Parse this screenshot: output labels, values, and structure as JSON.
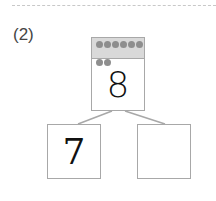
{
  "problem": {
    "label": "(2)",
    "whole": {
      "value": "8",
      "dot_count": 8,
      "dot_color": "#8e8e8e",
      "band_color": "#d9d9d9"
    },
    "parts": [
      {
        "value": "7"
      },
      {
        "value": ""
      }
    ]
  }
}
